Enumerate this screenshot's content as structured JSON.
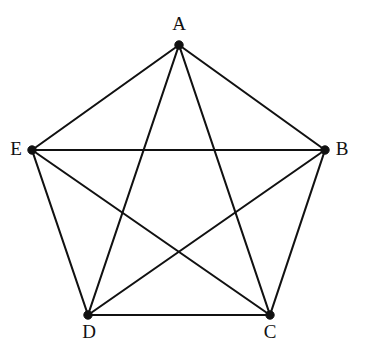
{
  "figure": {
    "background_color": "#ffffff",
    "line_color": "#111111",
    "vertex_color": "#111111",
    "label_color": "#111111",
    "width": 368,
    "height": 355
  },
  "chart_data": {
    "type": "diagram",
    "graph_type": "complete-graph-K5",
    "title": "",
    "vertex_count": 5,
    "edge_count": 10,
    "vertices": [
      {
        "id": "A",
        "label": "A",
        "x": 179,
        "y": 45,
        "label_x": 179,
        "label_y": 26,
        "label_position": "above",
        "degree": 4
      },
      {
        "id": "B",
        "label": "B",
        "x": 325,
        "y": 150,
        "label_x": 342,
        "label_y": 151,
        "label_position": "right",
        "degree": 4
      },
      {
        "id": "C",
        "label": "C",
        "x": 270,
        "y": 315,
        "label_x": 270,
        "label_y": 334,
        "label_position": "below",
        "degree": 4
      },
      {
        "id": "D",
        "label": "D",
        "x": 88,
        "y": 315,
        "label_x": 89,
        "label_y": 334,
        "label_position": "below",
        "degree": 4
      },
      {
        "id": "E",
        "label": "E",
        "x": 32,
        "y": 150,
        "label_x": 16,
        "label_y": 151,
        "label_position": "left",
        "degree": 4
      }
    ],
    "edges": [
      {
        "from": "A",
        "to": "B",
        "kind": "pentagon-side"
      },
      {
        "from": "B",
        "to": "C",
        "kind": "pentagon-side"
      },
      {
        "from": "C",
        "to": "D",
        "kind": "pentagon-side"
      },
      {
        "from": "D",
        "to": "E",
        "kind": "pentagon-side"
      },
      {
        "from": "E",
        "to": "A",
        "kind": "pentagon-side"
      },
      {
        "from": "A",
        "to": "C",
        "kind": "diagonal"
      },
      {
        "from": "A",
        "to": "D",
        "kind": "diagonal"
      },
      {
        "from": "B",
        "to": "D",
        "kind": "diagonal"
      },
      {
        "from": "B",
        "to": "E",
        "kind": "diagonal"
      },
      {
        "from": "C",
        "to": "E",
        "kind": "diagonal"
      }
    ]
  }
}
